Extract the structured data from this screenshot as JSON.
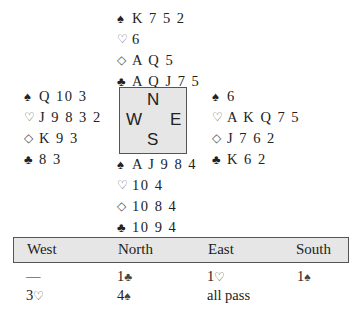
{
  "hands": {
    "north": {
      "spades": {
        "symbol": "♠",
        "cards": "K 7 5 2"
      },
      "hearts": {
        "symbol": "♡",
        "cards": "6"
      },
      "diamonds": {
        "symbol": "◇",
        "cards": "A Q 5"
      },
      "clubs": {
        "symbol": "♣",
        "cards": "A Q J 7 5"
      }
    },
    "west": {
      "spades": {
        "symbol": "♠",
        "cards": "Q 10 3"
      },
      "hearts": {
        "symbol": "♡",
        "cards": "J 9 8 3 2"
      },
      "diamonds": {
        "symbol": "◇",
        "cards": "K 9 3"
      },
      "clubs": {
        "symbol": "♣",
        "cards": "8 3"
      }
    },
    "east": {
      "spades": {
        "symbol": "♠",
        "cards": "6"
      },
      "hearts": {
        "symbol": "♡",
        "cards": "A K Q 7 5"
      },
      "diamonds": {
        "symbol": "◇",
        "cards": "J 7 6 2"
      },
      "clubs": {
        "symbol": "♣",
        "cards": "K 6 2"
      }
    },
    "south": {
      "spades": {
        "symbol": "♠",
        "cards": "A J 9 8 4"
      },
      "hearts": {
        "symbol": "♡",
        "cards": "10 4"
      },
      "diamonds": {
        "symbol": "◇",
        "cards": "10 8 4"
      },
      "clubs": {
        "symbol": "♣",
        "cards": "10 9 4"
      }
    }
  },
  "compass": {
    "north": "N",
    "west": "W",
    "east": "E",
    "south": "S"
  },
  "auction": {
    "headers": [
      "West",
      "North",
      "East",
      "South"
    ],
    "rounds": [
      [
        {
          "level": "—",
          "suit": ""
        },
        {
          "level": "1",
          "suit": "♣"
        },
        {
          "level": "1",
          "suit": "♡"
        },
        {
          "level": "1",
          "suit": "♠"
        }
      ],
      [
        {
          "level": "3",
          "suit": "♡"
        },
        {
          "level": "4",
          "suit": "♠"
        },
        {
          "level": "all pass",
          "suit": ""
        }
      ]
    ]
  }
}
